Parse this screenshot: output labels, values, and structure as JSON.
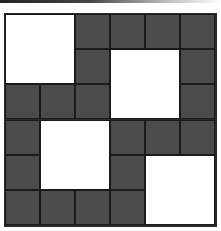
{
  "diagram": {
    "type": "grid-tiling",
    "rows": 6,
    "cols": 6,
    "colors": {
      "dark": "#4b4b4b",
      "light": "#ffffff",
      "border": "#1a1a1a"
    },
    "light_blocks": [
      {
        "row": 0,
        "col": 0,
        "rowspan": 2,
        "colspan": 2
      },
      {
        "row": 1,
        "col": 3,
        "rowspan": 2,
        "colspan": 2
      },
      {
        "row": 3,
        "col": 1,
        "rowspan": 2,
        "colspan": 2
      },
      {
        "row": 4,
        "col": 4,
        "rowspan": 2,
        "colspan": 2
      }
    ],
    "dark_cells": [
      [
        0,
        2
      ],
      [
        0,
        3
      ],
      [
        0,
        4
      ],
      [
        0,
        5
      ],
      [
        1,
        2
      ],
      [
        1,
        5
      ],
      [
        2,
        0
      ],
      [
        2,
        1
      ],
      [
        2,
        2
      ],
      [
        2,
        5
      ],
      [
        3,
        0
      ],
      [
        3,
        3
      ],
      [
        3,
        4
      ],
      [
        3,
        5
      ],
      [
        4,
        0
      ],
      [
        4,
        3
      ],
      [
        5,
        0
      ],
      [
        5,
        1
      ],
      [
        5,
        2
      ],
      [
        5,
        3
      ]
    ]
  }
}
